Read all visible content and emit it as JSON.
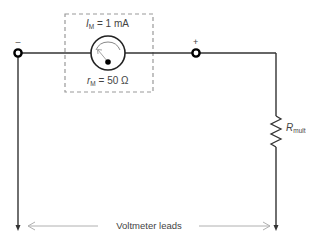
{
  "diagram": {
    "type": "circuit",
    "meter": {
      "current_label_main": "I",
      "current_label_sub": "M",
      "current_value": " = 1 mA",
      "resistance_label_main": "r",
      "resistance_label_sub": "M",
      "resistance_value": " = 50 Ω"
    },
    "terminals": {
      "negative": "–",
      "positive": "+"
    },
    "resistor": {
      "label_main": "R",
      "label_sub": "mult"
    },
    "leads_label": "Voltmeter leads",
    "colors": {
      "wire": "#333333",
      "dashed_box": "#999999",
      "leads_arrow": "#b0b0b0",
      "text": "#444444"
    }
  }
}
